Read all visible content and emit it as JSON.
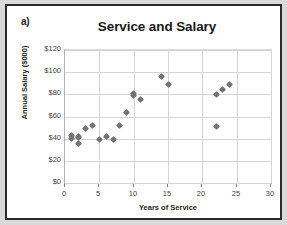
{
  "figure": {
    "panel_label": "a)"
  },
  "chart_data": {
    "type": "scatter",
    "title": "Service and Salary",
    "xlabel": "Years of Service",
    "ylabel": "Annual Salary ($000)",
    "xlim": [
      0,
      30
    ],
    "ylim": [
      0,
      120
    ],
    "grid": true,
    "legend": "none",
    "marker_color": "#737373",
    "marker_shape": "diamond",
    "xticks": [
      0,
      5,
      10,
      15,
      20,
      25,
      30
    ],
    "xtick_labels": [
      "0",
      "5",
      "10",
      "15",
      "20",
      "25",
      "30"
    ],
    "yticks": [
      0,
      20,
      40,
      60,
      80,
      100,
      120
    ],
    "ytick_labels": [
      "$0",
      "$20",
      "$40",
      "$60",
      "$80",
      "$100",
      "$120"
    ],
    "series": [
      {
        "name": "Employees",
        "points": [
          {
            "x": 1,
            "y": 43
          },
          {
            "x": 1,
            "y": 40
          },
          {
            "x": 2,
            "y": 42
          },
          {
            "x": 2,
            "y": 41
          },
          {
            "x": 2,
            "y": 36
          },
          {
            "x": 3,
            "y": 49
          },
          {
            "x": 4,
            "y": 52
          },
          {
            "x": 5,
            "y": 39
          },
          {
            "x": 6,
            "y": 42
          },
          {
            "x": 7,
            "y": 39
          },
          {
            "x": 8,
            "y": 52
          },
          {
            "x": 9,
            "y": 64
          },
          {
            "x": 10,
            "y": 81
          },
          {
            "x": 10,
            "y": 79
          },
          {
            "x": 11,
            "y": 75
          },
          {
            "x": 14,
            "y": 96
          },
          {
            "x": 15,
            "y": 89
          },
          {
            "x": 22,
            "y": 80
          },
          {
            "x": 22,
            "y": 51
          },
          {
            "x": 23,
            "y": 84
          },
          {
            "x": 24,
            "y": 89
          }
        ]
      }
    ]
  }
}
